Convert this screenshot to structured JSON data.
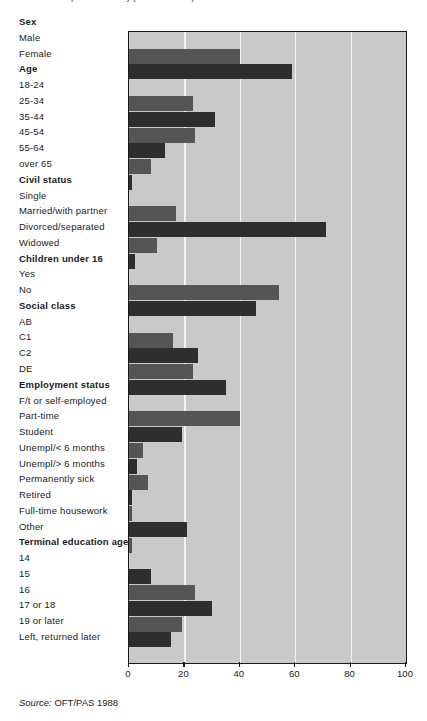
{
  "title_clipped": "as part of a survey (Base: n = 2001)",
  "source_label": "Source:",
  "source_value": "OFT/PAS 1988",
  "axis": {
    "ticks": [
      0,
      20,
      40,
      60,
      80,
      100
    ],
    "min": 0,
    "max": 100
  },
  "colors": {
    "plot_background": "#c9c9c9",
    "gridline": "#f2f2f2",
    "bar_medium": "#555555",
    "bar_dark": "#2e2e2e",
    "axis": "#1a1a1a",
    "text": "#1a1a1a"
  },
  "chart_data": {
    "type": "bar",
    "orientation": "horizontal",
    "title": "as part of a survey (Base: n = 2001)",
    "xlabel": "",
    "ylabel": "",
    "xlim": [
      0,
      100
    ],
    "grid": true,
    "legend": "none",
    "source": "Source: OFT/PAS 1988",
    "rows": [
      {
        "label": "Sex",
        "group": true
      },
      {
        "label": "Male",
        "value": 40,
        "shade": "medium"
      },
      {
        "label": "Female",
        "value": 59,
        "shade": "dark"
      },
      {
        "label": "Age",
        "group": true
      },
      {
        "label": "18-24",
        "value": 23,
        "shade": "medium"
      },
      {
        "label": "25-34",
        "value": 31,
        "shade": "dark"
      },
      {
        "label": "35-44",
        "value": 24,
        "shade": "medium"
      },
      {
        "label": "45-54",
        "value": 13,
        "shade": "dark"
      },
      {
        "label": "55-64",
        "value": 8,
        "shade": "medium"
      },
      {
        "label": "over 65",
        "value": 1,
        "shade": "dark"
      },
      {
        "label": "Civil status",
        "group": true
      },
      {
        "label": "Single",
        "value": 17,
        "shade": "medium"
      },
      {
        "label": "Married/with partner",
        "value": 71,
        "shade": "dark"
      },
      {
        "label": "Divorced/separated",
        "value": 10,
        "shade": "medium"
      },
      {
        "label": "Widowed",
        "value": 2,
        "shade": "dark"
      },
      {
        "label": "Children under 16",
        "group": true
      },
      {
        "label": "Yes",
        "value": 54,
        "shade": "medium"
      },
      {
        "label": "No",
        "value": 46,
        "shade": "dark"
      },
      {
        "label": "Social class",
        "group": true
      },
      {
        "label": "AB",
        "value": 16,
        "shade": "medium"
      },
      {
        "label": "C1",
        "value": 25,
        "shade": "dark"
      },
      {
        "label": "C2",
        "value": 23,
        "shade": "medium"
      },
      {
        "label": "DE",
        "value": 35,
        "shade": "dark"
      },
      {
        "label": "Employment status",
        "group": true
      },
      {
        "label": "F/t or self-employed",
        "value": 40,
        "shade": "medium"
      },
      {
        "label": "Part-time",
        "value": 19,
        "shade": "dark"
      },
      {
        "label": "Student",
        "value": 5,
        "shade": "medium"
      },
      {
        "label": "Unempl/< 6 months",
        "value": 3,
        "shade": "dark"
      },
      {
        "label": "Unempl/> 6 months",
        "value": 7,
        "shade": "medium"
      },
      {
        "label": "Permanently sick",
        "value": 1,
        "shade": "dark"
      },
      {
        "label": "Retired",
        "value": 1,
        "shade": "medium"
      },
      {
        "label": "Full-time housework",
        "value": 21,
        "shade": "dark"
      },
      {
        "label": "Other",
        "value": 1,
        "shade": "medium"
      },
      {
        "label": "Terminal education age",
        "group": true
      },
      {
        "label": "14",
        "value": 8,
        "shade": "dark"
      },
      {
        "label": "15",
        "value": 24,
        "shade": "medium"
      },
      {
        "label": "16",
        "value": 30,
        "shade": "dark"
      },
      {
        "label": "17 or 18",
        "value": 19,
        "shade": "medium"
      },
      {
        "label": "19 or later",
        "value": 15,
        "shade": "dark"
      },
      {
        "label": "Left, returned later",
        "value": 0,
        "shade": "medium"
      }
    ]
  }
}
